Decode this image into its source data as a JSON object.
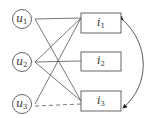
{
  "diagram": {
    "users": [
      {
        "label": "u",
        "sub": "1"
      },
      {
        "label": "u",
        "sub": "2"
      },
      {
        "label": "u",
        "sub": "3"
      }
    ],
    "items": [
      {
        "label": "i",
        "sub": "1"
      },
      {
        "label": "i",
        "sub": "2"
      },
      {
        "label": "i",
        "sub": "3"
      }
    ],
    "edges": [
      {
        "from": "u1",
        "to": "i1",
        "style": "solid"
      },
      {
        "from": "u1",
        "to": "i3",
        "style": "solid"
      },
      {
        "from": "u2",
        "to": "i1",
        "style": "solid"
      },
      {
        "from": "u2",
        "to": "i2",
        "style": "solid"
      },
      {
        "from": "u2",
        "to": "i3",
        "style": "solid"
      },
      {
        "from": "u3",
        "to": "i1",
        "style": "solid"
      },
      {
        "from": "u3",
        "to": "i3",
        "style": "dashed"
      },
      {
        "from": "i1",
        "to": "i3",
        "style": "curved-bidirectional-arrow"
      }
    ],
    "line_color": "#555555"
  }
}
